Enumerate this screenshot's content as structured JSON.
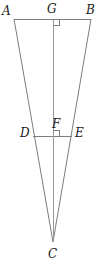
{
  "figure": {
    "type": "geometry-diagram",
    "canvas": {
      "width": 101,
      "height": 267
    },
    "stroke_color": "#7d7d7d",
    "label_color": "#1a1a1a",
    "background_color": "#ffffff",
    "stroke_width": 1,
    "points": [
      {
        "id": "A",
        "label": "A",
        "x": 14,
        "y": 19,
        "label_x": 2,
        "label_y": 5
      },
      {
        "id": "B",
        "label": "B",
        "x": 91,
        "y": 19,
        "label_x": 86,
        "label_y": 4
      },
      {
        "id": "C",
        "label": "C",
        "x": 53,
        "y": 242,
        "label_x": 48,
        "label_y": 248
      },
      {
        "id": "D",
        "label": "D",
        "x": 33,
        "y": 136,
        "label_x": 20,
        "label_y": 127
      },
      {
        "id": "E",
        "label": "E",
        "x": 72,
        "y": 136,
        "label_x": 75,
        "label_y": 127
      },
      {
        "id": "F",
        "label": "F",
        "x": 53,
        "y": 136,
        "label_x": 52,
        "label_y": 118
      },
      {
        "id": "G",
        "label": "G",
        "x": 53,
        "y": 19,
        "label_x": 47,
        "label_y": 3
      }
    ],
    "segments": [
      {
        "id": "AB",
        "from": "A",
        "to": "B",
        "name": "segment-ab"
      },
      {
        "id": "AC",
        "from": "A",
        "to": "C",
        "name": "segment-ac"
      },
      {
        "id": "BC",
        "from": "B",
        "to": "C",
        "name": "segment-bc"
      },
      {
        "id": "DE",
        "from": "D",
        "to": "E",
        "name": "segment-de"
      },
      {
        "id": "GC",
        "from": "G",
        "to": "C",
        "name": "segment-gc-altitude"
      }
    ],
    "right_angles": [
      {
        "id": "angle-at-G",
        "vertex_x": 53,
        "vertex_y": 19,
        "size": 6,
        "dir_x": 1,
        "dir_y": 1
      },
      {
        "id": "angle-at-F",
        "vertex_x": 53,
        "vertex_y": 136,
        "size": 6,
        "dir_x": 1,
        "dir_y": -1
      }
    ]
  }
}
